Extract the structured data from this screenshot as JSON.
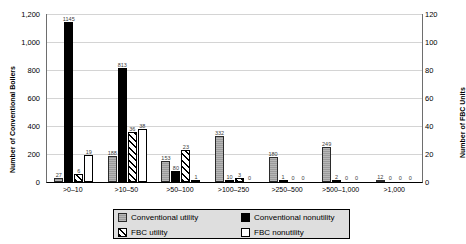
{
  "chart_data": {
    "type": "bar",
    "title": "",
    "xlabel": "",
    "ylabel": "Number of Conventional Boilers",
    "y2label": "Number of FBC Units",
    "ylim": [
      0,
      1200
    ],
    "y2lim": [
      0,
      120
    ],
    "yticks": [
      "0",
      "200",
      "400",
      "600",
      "800",
      "1,000",
      "1,200"
    ],
    "ytick_values": [
      0,
      200,
      400,
      600,
      800,
      1000,
      1200
    ],
    "y2ticks": [
      "0",
      "20",
      "40",
      "60",
      "80",
      "100",
      "120"
    ],
    "y2tick_values": [
      0,
      20,
      40,
      60,
      80,
      100,
      120
    ],
    "grid": true,
    "legend_position": "bottom",
    "categories": [
      ">0–10",
      ">10–50",
      ">50–100",
      ">100–250",
      ">250–500",
      ">500–1,000",
      ">1,000"
    ],
    "series": [
      {
        "name": "Conventional utility",
        "axis": "left",
        "values": [
          27,
          188,
          153,
          332,
          180,
          249,
          12
        ]
      },
      {
        "name": "Conventional nonutility",
        "axis": "left",
        "values": [
          1145,
          813,
          80,
          10,
          1,
          2,
          0
        ]
      },
      {
        "name": "FBC utility",
        "axis": "right",
        "values": [
          6,
          36,
          23,
          3,
          0,
          0,
          0
        ]
      },
      {
        "name": "FBC nonutility",
        "axis": "right",
        "values": [
          19,
          38,
          1,
          0,
          0,
          0,
          0
        ]
      }
    ]
  },
  "legend": {
    "items": [
      {
        "label": "Conventional utility",
        "key": "conv-util"
      },
      {
        "label": "Conventional nonutility",
        "key": "conv-nonutil"
      },
      {
        "label": "FBC utility",
        "key": "fbc-util"
      },
      {
        "label": "FBC nonutility",
        "key": "fbc-nonutil"
      }
    ]
  }
}
